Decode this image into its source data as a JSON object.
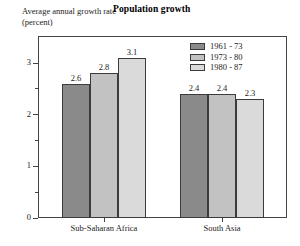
{
  "chart_data": {
    "type": "bar",
    "title": "Population growth",
    "ylabel": "Average annual growth rate (percent)",
    "xlabel": "",
    "categories": [
      "Sub-Saharan Africa",
      "South Asia"
    ],
    "series": [
      {
        "name": "1961 - 73",
        "values": [
          2.6,
          2.4
        ],
        "color": "#8a8a8a"
      },
      {
        "name": "1973 - 80",
        "values": [
          2.8,
          2.4
        ],
        "color": "#c2c2c2"
      },
      {
        "name": "1980 - 87",
        "values": [
          3.1,
          2.3
        ],
        "color": "#dadada"
      }
    ],
    "ylim": [
      0,
      3.2
    ],
    "yticks": [
      0,
      1,
      2,
      3
    ],
    "ytick_labels": [
      "0",
      "1",
      "2",
      "3"
    ],
    "yminor_ticks": [
      0.5,
      1.5,
      2.5
    ],
    "data_labels": [
      "2.6",
      "2.8",
      "3.1",
      "2.4",
      "2.4",
      "2.3"
    ],
    "grid": false,
    "legend_position": "top-right",
    "frame": true
  },
  "legend": {
    "entries": [
      {
        "label": "1961 - 73"
      },
      {
        "label": "1973 - 80"
      },
      {
        "label": "1980 - 87"
      }
    ]
  }
}
